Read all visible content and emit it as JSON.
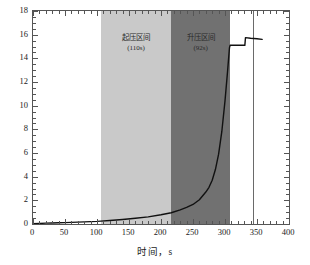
{
  "chart_data": {
    "type": "line",
    "title": "",
    "xlabel": "时间，s",
    "ylabel": "入口压力，MPa",
    "xlim": [
      0,
      400
    ],
    "ylim": [
      0,
      18
    ],
    "xticks": [
      0,
      50,
      100,
      150,
      200,
      250,
      300,
      350,
      400
    ],
    "yticks": [
      0,
      2,
      4,
      6,
      8,
      10,
      12,
      14,
      16,
      18
    ],
    "xtick_labels": [
      "0",
      "50",
      "100",
      "150",
      "200",
      "250",
      "300",
      "350",
      "400"
    ],
    "ytick_labels": [
      "0",
      "2",
      "4",
      "6",
      "8",
      "10",
      "12",
      "14",
      "16",
      "18"
    ],
    "x_minor_step": 10,
    "y_minor_step": 0.5,
    "grid": false,
    "legend": null,
    "series": [
      {
        "name": "入口压力",
        "color": "#111111",
        "x": [
          0,
          10,
          20,
          30,
          40,
          50,
          60,
          70,
          80,
          90,
          100,
          106,
          120,
          140,
          160,
          180,
          200,
          216,
          230,
          240,
          250,
          260,
          270,
          275,
          280,
          285,
          290,
          295,
          300,
          304,
          307,
          308,
          316,
          326,
          331,
          332,
          340,
          350,
          358
        ],
        "y": [
          0.02,
          0.05,
          0.07,
          0.09,
          0.1,
          0.12,
          0.14,
          0.16,
          0.18,
          0.2,
          0.22,
          0.24,
          0.3,
          0.38,
          0.48,
          0.6,
          0.78,
          0.95,
          1.2,
          1.4,
          1.65,
          2.05,
          2.7,
          3.1,
          3.7,
          4.6,
          5.9,
          7.8,
          10.4,
          12.9,
          14.9,
          15.1,
          15.1,
          15.1,
          15.1,
          15.75,
          15.7,
          15.65,
          15.6
        ]
      }
    ],
    "bands": [
      {
        "name": "起压区间",
        "label": "起压区间",
        "sub_label": "(110s)",
        "x_start": 106,
        "x_end": 216,
        "duration_s": 110,
        "color": "#c9c9c9"
      },
      {
        "name": "升压区间",
        "label": "升压区间",
        "sub_label": "(92s)",
        "x_start": 216,
        "x_end": 308,
        "duration_s": 92,
        "color": "#717171"
      }
    ],
    "reference_lines": [
      {
        "name": "vertical-marker",
        "orientation": "vertical",
        "x": 343,
        "color": "#6a6a6a"
      }
    ]
  }
}
